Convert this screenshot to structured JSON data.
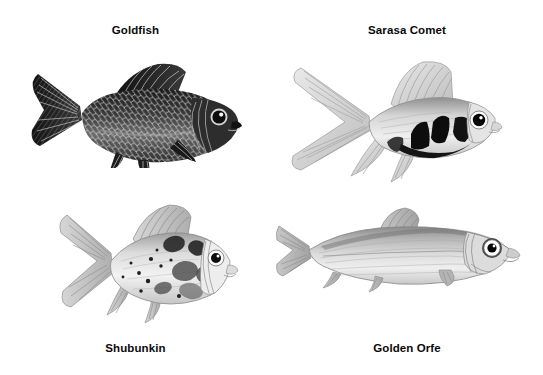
{
  "page": {
    "background_color": "#ffffff",
    "width": 543,
    "height": 375,
    "style": "black and white pen-and-ink / pencil natural history illustrations of four ornamental pond fish arranged in a 2x2 grid, each with a bold caption"
  },
  "figures": [
    {
      "id": "goldfish",
      "caption": "Goldfish",
      "caption_position": "top",
      "caption_center_x": 168,
      "caption_y": 24,
      "illustration": {
        "name": "goldfish-illustration",
        "subject": "Goldfish",
        "technique": "dense cross-hatched engraving",
        "tone": "dark",
        "facing": "right",
        "body_shape": "deep oval stocky body with pronounced scale texture",
        "bounds": {
          "x": 28,
          "y": 58,
          "width": 215,
          "height": 108
        },
        "features": [
          "forked dark caudal fin",
          "tall triangular dorsal fin",
          "dark eye with bright highlight",
          "visible gill plate arcs",
          "pelvic and anal fins"
        ]
      }
    },
    {
      "id": "sarasa-comet",
      "caption": "Sarasa Comet",
      "caption_position": "top",
      "caption_center_x": 421,
      "caption_y": 24,
      "illustration": {
        "name": "sarasa-comet-illustration",
        "subject": "Sarasa Comet",
        "technique": "light pencil sketch with solid black patches",
        "tone": "light with high-contrast blotches",
        "facing": "right",
        "body_shape": "slim streamlined body with very long flowing fins",
        "bounds": {
          "x": 283,
          "y": 60,
          "width": 218,
          "height": 126
        },
        "features": [
          "long deeply forked comet tail",
          "tall sail-like dorsal fin",
          "bold black saddle markings behind the head",
          "large round black eye with white ring",
          "long trailing pelvic and anal fins"
        ]
      }
    },
    {
      "id": "shubunkin",
      "caption": "Shubunkin",
      "caption_position": "bottom",
      "caption_center_x": 165,
      "caption_y": 342,
      "illustration": {
        "name": "shubunkin-illustration",
        "subject": "Shubunkin",
        "technique": "pencil sketch with mottled calico spotting",
        "tone": "light with scattered dark blotches and speckles",
        "facing": "right",
        "body_shape": "deep rounded body, short snout",
        "bounds": {
          "x": 53,
          "y": 203,
          "width": 188,
          "height": 118
        },
        "features": [
          "calico mottled patches along flank",
          "fine dark speckles",
          "long flowing forked tail",
          "tall ridged dorsal fin",
          "round eye with dark pupil"
        ]
      }
    },
    {
      "id": "golden-orfe",
      "caption": "Golden Orfe",
      "caption_position": "bottom",
      "caption_center_x": 421,
      "caption_y": 342,
      "illustration": {
        "name": "golden-orfe-illustration",
        "subject": "Golden Orfe",
        "technique": "fine pencil shading with horizontal line texture",
        "tone": "mid-light, smooth graded shading",
        "facing": "right",
        "body_shape": "long slender torpedo-shaped cyprinid body",
        "bounds": {
          "x": 275,
          "y": 206,
          "width": 246,
          "height": 86
        },
        "features": [
          "small forked caudal fin",
          "small dorsal fin set mid-back",
          "large eye with white sclera ring and black pupil",
          "fine horizontal scale striations",
          "small paired pectoral and pelvic fins"
        ]
      }
    }
  ]
}
